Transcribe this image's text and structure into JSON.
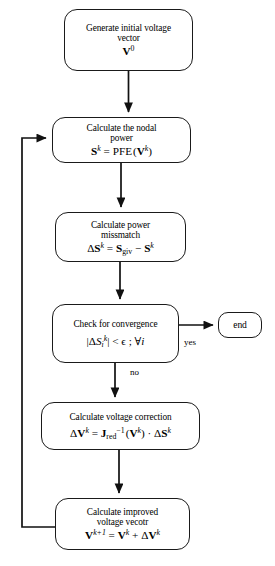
{
  "diagram": {
    "type": "flowchart",
    "colors": {
      "stroke": "#1a1a1a",
      "background": "#ffffff",
      "text": "#000000"
    },
    "nodes": [
      {
        "id": "start",
        "shape": "rounded-rectangle",
        "text_lines": [
          "Generate initial voltage",
          "vector"
        ],
        "formula": "V0",
        "formula_parts": {
          "base": "V",
          "sup": "0"
        }
      },
      {
        "id": "nodal",
        "shape": "rounded-rectangle",
        "text_lines": [
          "Calculate the nodal",
          "power"
        ],
        "formula": "Sk = PFE (Vk)",
        "formula_parts": {
          "lhs_base": "S",
          "lhs_sup": "k",
          "eq": "=",
          "fn": "PFE",
          "open": "(",
          "arg_base": "V",
          "arg_sup": "k",
          "close": ")"
        }
      },
      {
        "id": "mismatch",
        "shape": "rounded-rectangle",
        "text_lines": [
          "Calculate power",
          "missmatch"
        ],
        "formula": "ΔSk = Sgiv − Sk",
        "formula_parts": {
          "delta": "Δ",
          "lhs_base": "S",
          "lhs_sup": "k",
          "eq": "=",
          "t1_base": "S",
          "t1_sub": "giv",
          "minus": "−",
          "t2_base": "S",
          "t2_sup": "k"
        }
      },
      {
        "id": "check",
        "shape": "rounded-rectangle",
        "text_lines": [
          "Check for convergence"
        ],
        "formula": "|ΔSik| < ϵ ; ∀i",
        "formula_parts": {
          "bar_open": "|",
          "delta": "Δ",
          "base": "S",
          "sub": "i",
          "sup": "k",
          "bar_close": "|",
          "rel": "<",
          "eps": "ϵ",
          "semi": ";",
          "forall": "∀",
          "idx": "i"
        }
      },
      {
        "id": "correction",
        "shape": "rounded-rectangle",
        "text_lines": [
          "Calculate voltage correction"
        ],
        "formula": "ΔVk = Jred−1 (Vk) · ΔSk",
        "formula_parts": {
          "delta": "Δ",
          "lhs_base": "V",
          "lhs_sup": "k",
          "eq": "=",
          "j_base": "J",
          "j_sub": "red",
          "j_sup": "−1",
          "open": "(",
          "arg_base": "V",
          "arg_sup": "k",
          "close": ")",
          "dot": "·",
          "delta2": "Δ",
          "t_base": "S",
          "t_sup": "k"
        }
      },
      {
        "id": "improved",
        "shape": "rounded-rectangle",
        "text_lines": [
          "Calculate improved",
          "voltage vecotr"
        ],
        "formula": "Vk+1 = Vk + ΔVk",
        "formula_parts": {
          "lhs_base": "V",
          "lhs_sup": "k+1",
          "eq": "=",
          "t1_base": "V",
          "t1_sup": "k",
          "plus": "+",
          "delta": "Δ",
          "t2_base": "V",
          "t2_sup": "k"
        }
      },
      {
        "id": "end",
        "shape": "rounded-rectangle-terminal",
        "text_lines": [
          "end"
        ]
      }
    ],
    "edges": [
      {
        "from": "start",
        "to": "nodal",
        "label": ""
      },
      {
        "from": "nodal",
        "to": "mismatch",
        "label": ""
      },
      {
        "from": "mismatch",
        "to": "check",
        "label": ""
      },
      {
        "from": "check",
        "to": "end",
        "label": "yes"
      },
      {
        "from": "check",
        "to": "correction",
        "label": "no"
      },
      {
        "from": "correction",
        "to": "improved",
        "label": ""
      },
      {
        "from": "improved",
        "to": "nodal",
        "label": "",
        "style": "feedback-loop-left"
      }
    ],
    "labels": {
      "yes": "yes",
      "no": "no"
    }
  }
}
